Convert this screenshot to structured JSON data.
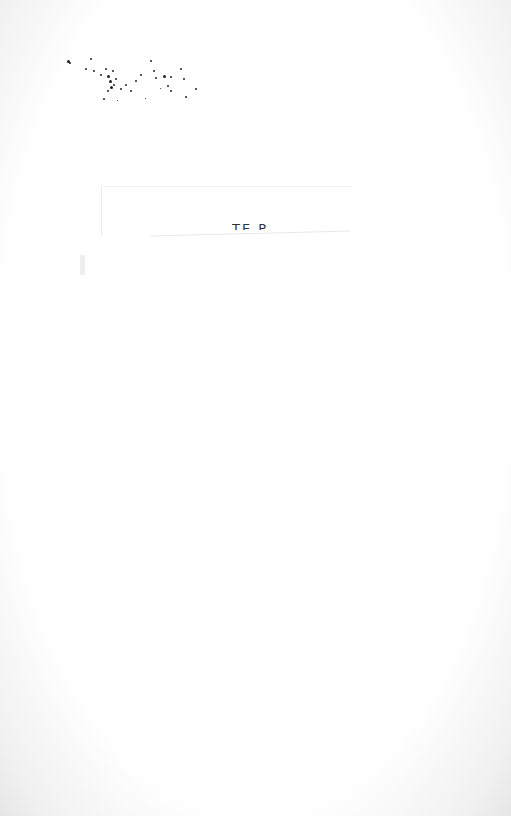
{
  "document": {
    "text_fragment": "TE P",
    "noise_region": "speckle-cluster",
    "colors": {
      "paper": "#ffffff",
      "ink": "#222222",
      "edge": "#e6e6e6"
    }
  }
}
